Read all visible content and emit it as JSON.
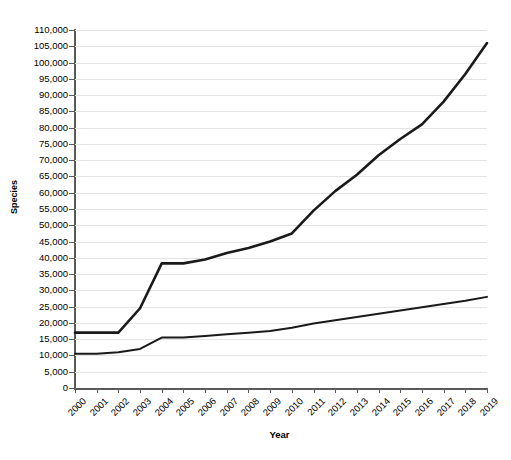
{
  "chart_data": {
    "type": "line",
    "title": "",
    "xlabel": "Year",
    "ylabel": "Species",
    "x": [
      2000,
      2001,
      2002,
      2003,
      2004,
      2005,
      2006,
      2007,
      2008,
      2009,
      2010,
      2011,
      2012,
      2013,
      2014,
      2015,
      2016,
      2017,
      2018,
      2019
    ],
    "categories": [
      "2000",
      "2001",
      "2002",
      "2003",
      "2004",
      "2005",
      "2006",
      "2007",
      "2008",
      "2009",
      "2010",
      "2011",
      "2012",
      "2013",
      "2014",
      "2015",
      "2016",
      "2017",
      "2018",
      "2019"
    ],
    "ylim": [
      0,
      110000
    ],
    "xlim": [
      2000,
      2019
    ],
    "yticks": [
      0,
      5000,
      10000,
      15000,
      20000,
      25000,
      30000,
      35000,
      40000,
      45000,
      50000,
      55000,
      60000,
      65000,
      70000,
      75000,
      80000,
      85000,
      90000,
      95000,
      100000,
      105000,
      110000
    ],
    "ytick_labels": [
      "0",
      "5,000",
      "10,000",
      "15,000",
      "20,000",
      "25,000",
      "30,000",
      "35,000",
      "40,000",
      "45,000",
      "50,000",
      "55,000",
      "60,000",
      "65,000",
      "70,000",
      "75,000",
      "80,000",
      "85,000",
      "90,000",
      "95,000",
      "100,000",
      "105,000",
      "110,000"
    ],
    "grid": true,
    "legend": false,
    "legend_position": "none",
    "line_color": "#1a1a1a",
    "grid_color": "#e4e4e4",
    "axis_color": "#5a5a5a",
    "background_color": "#ffffff",
    "series": [
      {
        "name": "upper-series",
        "stroke_width": 2.6,
        "values": [
          17000,
          17000,
          17000,
          24500,
          38300,
          38300,
          39500,
          41500,
          43000,
          45000,
          47500,
          54500,
          60500,
          65500,
          71500,
          76500,
          81000,
          88000,
          96500,
          106000
        ]
      },
      {
        "name": "lower-series",
        "stroke_width": 2.0,
        "values": [
          10500,
          10500,
          11000,
          12000,
          15500,
          15500,
          16000,
          16500,
          17000,
          17500,
          18500,
          19800,
          20800,
          21800,
          22800,
          23800,
          24800,
          25800,
          26800,
          28000
        ]
      }
    ]
  }
}
